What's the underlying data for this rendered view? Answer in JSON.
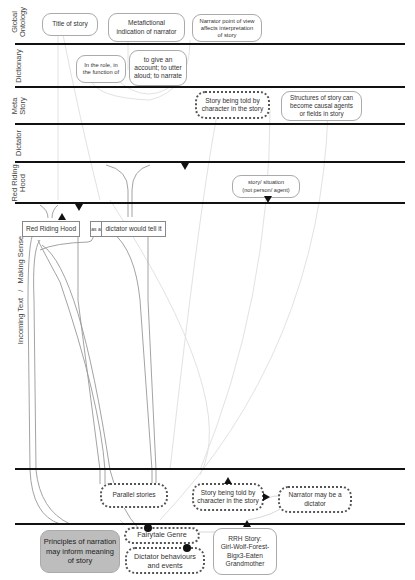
{
  "lanes": [
    {
      "id": "global-ontology",
      "label": "Global\nOntology"
    },
    {
      "id": "dictionary",
      "label": "Dictionary"
    },
    {
      "id": "meta-story",
      "label": "Meta\nStory"
    },
    {
      "id": "dictator",
      "label": "Dictator"
    },
    {
      "id": "red-riding-hood",
      "label": "Red Riding\nHood"
    },
    {
      "id": "incoming-text",
      "label": "Incoming Text   /   Making Sense"
    }
  ],
  "nodes": {
    "title_of_story": "Title of story",
    "metafictional": "Metafictional\nindication of narrator",
    "narrator_pov": "Narrator point of view\naffects interpretation\nof story",
    "in_the_role": "In the role, in\nthe function of",
    "to_give_account": "to give an\naccount; to utter\naloud; to narrate",
    "story_told_by_character_meta": "Story being told by\ncharacter in the story",
    "structures_of_story": "Structures of story can\nbecome causal agents\nor fields in story",
    "story_situation": "story/ situation\n(not person/ agent)",
    "red_riding_hood_box": "Red Riding Hood",
    "as_a": "as a",
    "dictator_would_tell": "dictator would tell it",
    "parallel_stories": "Parallel stories",
    "story_told_by_character_lower": "Story being told by\ncharacter in the story",
    "narrator_may_be_dictator": "Narrator may be a\ndictator",
    "principles_of_narration": "Principles of narration\nmay inform meaning\nof story",
    "fairytale_genre": "Fairytale Genre",
    "dictator_behaviours": "Dictator behaviours\nand events",
    "rrh_story": "RRH Story:\nGirl-Wolf-Forest-\nBigx3-Eaten\nGrandmother"
  },
  "colors": {
    "rule": "#111111",
    "node_border": "#aaaaaa",
    "link": "#999999",
    "faint_link": "#dddddd",
    "filled_node": "#bdbdbd"
  }
}
